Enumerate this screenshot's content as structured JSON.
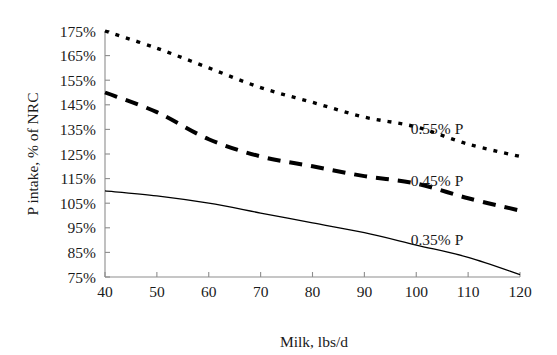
{
  "chart_data": {
    "type": "line",
    "title": "",
    "xlabel": "Milk, lbs/d",
    "ylabel": "P intake, % of NRC",
    "xlim": [
      40,
      120
    ],
    "ylim": [
      75,
      175
    ],
    "xticks": [
      40,
      50,
      60,
      70,
      80,
      90,
      100,
      110,
      120
    ],
    "yticks": [
      75,
      85,
      95,
      105,
      115,
      125,
      135,
      145,
      155,
      165,
      175
    ],
    "ytick_labels": [
      "75%",
      "85%",
      "95%",
      "105%",
      "115%",
      "125%",
      "135%",
      "145%",
      "155%",
      "165%",
      "175%"
    ],
    "xtick_labels": [
      "40",
      "50",
      "60",
      "70",
      "80",
      "90",
      "100",
      "110",
      "120"
    ],
    "grid": false,
    "legend_position": "inline-right",
    "x": [
      40,
      50,
      60,
      70,
      80,
      90,
      100,
      110,
      120
    ],
    "series": [
      {
        "name": "0.55% P",
        "style": "dotted",
        "color": "#000000",
        "values": [
          175,
          168,
          160,
          152,
          146,
          140,
          136,
          129,
          124
        ],
        "label_x": 104,
        "label_y": 133
      },
      {
        "name": "0.45% P",
        "style": "dashed",
        "color": "#000000",
        "values": [
          150,
          142,
          131,
          124,
          120,
          116,
          113,
          107,
          102
        ],
        "label_x": 104,
        "label_y": 112
      },
      {
        "name": "0.35% P",
        "style": "solid",
        "color": "#000000",
        "values": [
          110,
          108,
          105,
          101,
          97,
          93,
          88,
          83,
          76
        ],
        "label_x": 104,
        "label_y": 88
      }
    ]
  },
  "axis": {
    "x_title": "Milk, lbs/d",
    "y_title": "P intake, % of NRC",
    "axis_color": "#8d8d8d"
  }
}
